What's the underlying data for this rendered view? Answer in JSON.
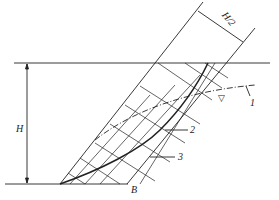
{
  "diagram": {
    "labels": {
      "height": "H",
      "half_height": "H/2",
      "point_b": "B",
      "curve_1": "1",
      "curve_2": "2",
      "curve_3": "3",
      "water_level_symbol": "▽"
    },
    "colors": {
      "line": "#222222",
      "background": "#ffffff"
    }
  }
}
